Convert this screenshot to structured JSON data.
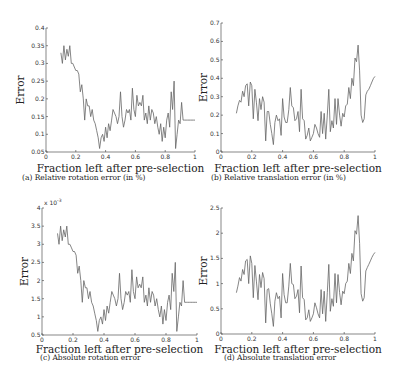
{
  "figure": {
    "panels": [
      {
        "id": "a",
        "caption": "(a)  Relative rotation error (in %)"
      },
      {
        "id": "b",
        "caption": "(b)  Relative translation error (in %)"
      },
      {
        "id": "c",
        "caption": "(c)  Absolute rotation error"
      },
      {
        "id": "d",
        "caption": "(d)  Absolute translation error"
      }
    ]
  },
  "chart_data": [
    {
      "type": "line",
      "title": "(a) Relative rotation error (in %)",
      "xlabel": "Fraction left after pre-selection",
      "ylabel": "Error",
      "xlim": [
        0,
        1
      ],
      "ylim": [
        0.05,
        0.4
      ],
      "xticks": [
        "0",
        "0.2",
        "0.4",
        "0.6",
        "0.8",
        "1"
      ],
      "yticks": [
        "0.05",
        "0.1",
        "0.15",
        "0.2",
        "0.25",
        "0.3",
        "0.35",
        "0.4"
      ],
      "grid": false,
      "x": [
        0.1,
        0.11,
        0.12,
        0.13,
        0.14,
        0.15,
        0.16,
        0.17,
        0.18,
        0.19,
        0.2,
        0.21,
        0.22,
        0.23,
        0.24,
        0.25,
        0.26,
        0.27,
        0.28,
        0.29,
        0.3,
        0.31,
        0.32,
        0.33,
        0.34,
        0.35,
        0.36,
        0.37,
        0.38,
        0.39,
        0.4,
        0.41,
        0.42,
        0.43,
        0.44,
        0.45,
        0.46,
        0.47,
        0.48,
        0.49,
        0.5,
        0.51,
        0.52,
        0.53,
        0.54,
        0.55,
        0.56,
        0.57,
        0.58,
        0.59,
        0.6,
        0.61,
        0.62,
        0.63,
        0.64,
        0.65,
        0.66,
        0.67,
        0.68,
        0.69,
        0.7,
        0.71,
        0.72,
        0.73,
        0.74,
        0.75,
        0.76,
        0.77,
        0.78,
        0.79,
        0.8,
        0.81,
        0.82,
        0.83,
        0.84,
        0.85,
        0.86,
        0.87,
        0.88,
        0.89,
        0.9,
        0.91,
        0.92,
        0.93,
        0.94,
        0.95,
        0.96,
        0.97,
        0.98,
        0.99,
        1.0
      ],
      "values": [
        0.33,
        0.3,
        0.35,
        0.31,
        0.34,
        0.32,
        0.35,
        0.3,
        0.3,
        0.29,
        0.28,
        0.28,
        0.27,
        0.22,
        0.24,
        0.2,
        0.14,
        0.2,
        0.18,
        0.18,
        0.15,
        0.17,
        0.14,
        0.13,
        0.11,
        0.09,
        0.06,
        0.09,
        0.1,
        0.08,
        0.12,
        0.09,
        0.13,
        0.11,
        0.14,
        0.17,
        0.16,
        0.15,
        0.13,
        0.15,
        0.22,
        0.15,
        0.12,
        0.14,
        0.17,
        0.16,
        0.17,
        0.14,
        0.23,
        0.17,
        0.15,
        0.21,
        0.18,
        0.19,
        0.18,
        0.21,
        0.14,
        0.16,
        0.13,
        0.18,
        0.14,
        0.17,
        0.16,
        0.13,
        0.15,
        0.12,
        0.1,
        0.13,
        0.08,
        0.12,
        0.09,
        0.14,
        0.16,
        0.12,
        0.22,
        0.17,
        0.25,
        0.06,
        0.1,
        0.14,
        0.13,
        0.19,
        0.14,
        0.14,
        0.14,
        0.14,
        0.14,
        0.14,
        0.14,
        0.14,
        0.14
      ]
    },
    {
      "type": "line",
      "title": "(b) Relative translation error (in %)",
      "xlabel": "Fraction left after pre-selection",
      "ylabel": "Error",
      "xlim": [
        0,
        1
      ],
      "ylim": [
        0,
        0.7
      ],
      "xticks": [
        "0",
        "0.2",
        "0.4",
        "0.6",
        "0.8",
        "1"
      ],
      "yticks": [
        "0",
        "0.1",
        "0.2",
        "0.3",
        "0.4",
        "0.5",
        "0.6",
        "0.7"
      ],
      "grid": false,
      "x": [
        0.1,
        0.11,
        0.12,
        0.13,
        0.14,
        0.15,
        0.16,
        0.17,
        0.18,
        0.19,
        0.2,
        0.21,
        0.22,
        0.23,
        0.24,
        0.25,
        0.26,
        0.27,
        0.28,
        0.29,
        0.3,
        0.31,
        0.32,
        0.33,
        0.34,
        0.35,
        0.36,
        0.37,
        0.38,
        0.39,
        0.4,
        0.41,
        0.42,
        0.43,
        0.44,
        0.45,
        0.46,
        0.47,
        0.48,
        0.49,
        0.5,
        0.51,
        0.52,
        0.53,
        0.54,
        0.55,
        0.56,
        0.57,
        0.58,
        0.59,
        0.6,
        0.61,
        0.62,
        0.63,
        0.64,
        0.65,
        0.66,
        0.67,
        0.68,
        0.69,
        0.7,
        0.71,
        0.72,
        0.73,
        0.74,
        0.75,
        0.76,
        0.77,
        0.78,
        0.79,
        0.8,
        0.81,
        0.82,
        0.83,
        0.84,
        0.85,
        0.86,
        0.87,
        0.88,
        0.89,
        0.9,
        0.91,
        0.92,
        0.93,
        0.94,
        0.95,
        0.96,
        0.97,
        0.98,
        0.99,
        1.0
      ],
      "values": [
        0.21,
        0.25,
        0.28,
        0.27,
        0.33,
        0.3,
        0.36,
        0.37,
        0.25,
        0.38,
        0.36,
        0.18,
        0.34,
        0.27,
        0.17,
        0.29,
        0.23,
        0.3,
        0.27,
        0.06,
        0.22,
        0.22,
        0.15,
        0.1,
        0.04,
        0.16,
        0.2,
        0.17,
        0.18,
        0.09,
        0.29,
        0.19,
        0.16,
        0.16,
        0.23,
        0.35,
        0.25,
        0.24,
        0.17,
        0.18,
        0.22,
        0.11,
        0.34,
        0.18,
        0.17,
        0.07,
        0.09,
        0.13,
        0.06,
        0.08,
        0.1,
        0.15,
        0.13,
        0.1,
        0.08,
        0.22,
        0.1,
        0.21,
        0.07,
        0.2,
        0.34,
        0.11,
        0.17,
        0.13,
        0.29,
        0.15,
        0.29,
        0.2,
        0.14,
        0.21,
        0.19,
        0.25,
        0.26,
        0.35,
        0.29,
        0.4,
        0.36,
        0.51,
        0.49,
        0.58,
        0.44,
        0.2,
        0.16,
        0.18,
        0.31,
        0.33,
        0.34,
        0.36,
        0.38,
        0.4,
        0.41
      ]
    },
    {
      "type": "line",
      "title": "(c) Absolute rotation error",
      "xlabel": "Fraction left after pre-selection",
      "ylabel": "Error",
      "y_multiplier": "x 10^-3",
      "xlim": [
        0,
        1
      ],
      "ylim": [
        0.5,
        4
      ],
      "xticks": [
        "0",
        "0.2",
        "0.4",
        "0.6",
        "0.8",
        "1"
      ],
      "yticks": [
        "0.5",
        "1",
        "1.5",
        "2",
        "2.5",
        "3",
        "3.5",
        "4"
      ],
      "grid": false,
      "x": [
        0.1,
        0.11,
        0.12,
        0.13,
        0.14,
        0.15,
        0.16,
        0.17,
        0.18,
        0.19,
        0.2,
        0.21,
        0.22,
        0.23,
        0.24,
        0.25,
        0.26,
        0.27,
        0.28,
        0.29,
        0.3,
        0.31,
        0.32,
        0.33,
        0.34,
        0.35,
        0.36,
        0.37,
        0.38,
        0.39,
        0.4,
        0.41,
        0.42,
        0.43,
        0.44,
        0.45,
        0.46,
        0.47,
        0.48,
        0.49,
        0.5,
        0.51,
        0.52,
        0.53,
        0.54,
        0.55,
        0.56,
        0.57,
        0.58,
        0.59,
        0.6,
        0.61,
        0.62,
        0.63,
        0.64,
        0.65,
        0.66,
        0.67,
        0.68,
        0.69,
        0.7,
        0.71,
        0.72,
        0.73,
        0.74,
        0.75,
        0.76,
        0.77,
        0.78,
        0.79,
        0.8,
        0.81,
        0.82,
        0.83,
        0.84,
        0.85,
        0.86,
        0.87,
        0.88,
        0.89,
        0.9,
        0.91,
        0.92,
        0.93,
        0.94,
        0.95,
        0.96,
        0.97,
        0.98,
        0.99,
        1.0
      ],
      "values": [
        3.3,
        3.0,
        3.5,
        3.1,
        3.4,
        3.2,
        3.5,
        3.0,
        3.0,
        2.9,
        2.8,
        2.8,
        2.7,
        2.2,
        2.4,
        2.0,
        1.4,
        2.0,
        1.8,
        1.8,
        1.5,
        1.7,
        1.4,
        1.3,
        1.1,
        0.9,
        0.6,
        0.9,
        1.0,
        0.8,
        1.2,
        0.9,
        1.3,
        1.1,
        1.4,
        1.7,
        1.6,
        1.5,
        1.3,
        1.5,
        2.2,
        1.5,
        1.2,
        1.4,
        1.7,
        1.6,
        1.7,
        1.4,
        2.3,
        1.7,
        1.5,
        2.1,
        1.8,
        1.9,
        1.8,
        2.1,
        1.4,
        1.6,
        1.3,
        1.8,
        1.4,
        1.7,
        1.6,
        1.3,
        1.5,
        1.2,
        1.0,
        1.3,
        0.8,
        1.2,
        0.9,
        1.4,
        1.6,
        1.2,
        2.2,
        1.7,
        2.5,
        0.6,
        1.0,
        1.4,
        1.3,
        2.0,
        1.4,
        1.4,
        1.4,
        1.4,
        1.4,
        1.4,
        1.4,
        1.4,
        1.4
      ]
    },
    {
      "type": "line",
      "title": "(d) Absolute translation error",
      "xlabel": "Fraction left after pre-selection",
      "ylabel": "Error",
      "xlim": [
        0,
        1
      ],
      "ylim": [
        0,
        2.5
      ],
      "xticks": [
        "0",
        "0.2",
        "0.4",
        "0.6",
        "0.8",
        "1"
      ],
      "yticks": [
        "0",
        "0.5",
        "1",
        "1.5",
        "2",
        "2.5"
      ],
      "grid": false,
      "x": [
        0.1,
        0.11,
        0.12,
        0.13,
        0.14,
        0.15,
        0.16,
        0.17,
        0.18,
        0.19,
        0.2,
        0.21,
        0.22,
        0.23,
        0.24,
        0.25,
        0.26,
        0.27,
        0.28,
        0.29,
        0.3,
        0.31,
        0.32,
        0.33,
        0.34,
        0.35,
        0.36,
        0.37,
        0.38,
        0.39,
        0.4,
        0.41,
        0.42,
        0.43,
        0.44,
        0.45,
        0.46,
        0.47,
        0.48,
        0.49,
        0.5,
        0.51,
        0.52,
        0.53,
        0.54,
        0.55,
        0.56,
        0.57,
        0.58,
        0.59,
        0.6,
        0.61,
        0.62,
        0.63,
        0.64,
        0.65,
        0.66,
        0.67,
        0.68,
        0.69,
        0.7,
        0.71,
        0.72,
        0.73,
        0.74,
        0.75,
        0.76,
        0.77,
        0.78,
        0.79,
        0.8,
        0.81,
        0.82,
        0.83,
        0.84,
        0.85,
        0.86,
        0.87,
        0.88,
        0.89,
        0.9,
        0.91,
        0.92,
        0.93,
        0.94,
        0.95,
        0.96,
        0.97,
        0.98,
        0.99,
        1.0
      ],
      "values": [
        0.82,
        0.95,
        1.12,
        1.05,
        1.28,
        1.18,
        1.45,
        1.48,
        1.0,
        1.55,
        1.4,
        0.72,
        1.36,
        1.05,
        0.68,
        1.18,
        0.92,
        1.22,
        1.1,
        0.22,
        0.88,
        0.9,
        0.6,
        0.4,
        0.15,
        0.65,
        0.82,
        0.7,
        0.75,
        0.32,
        1.2,
        0.78,
        0.62,
        0.62,
        0.95,
        1.4,
        1.0,
        0.98,
        0.7,
        0.75,
        0.88,
        0.42,
        1.35,
        0.72,
        0.68,
        0.28,
        0.32,
        0.48,
        0.25,
        0.32,
        0.4,
        0.62,
        0.52,
        0.4,
        0.32,
        0.88,
        0.4,
        0.85,
        0.25,
        0.82,
        1.38,
        0.45,
        0.7,
        0.55,
        1.2,
        0.62,
        1.18,
        0.82,
        0.58,
        0.85,
        0.8,
        1.0,
        1.05,
        1.4,
        1.2,
        1.6,
        1.45,
        2.05,
        1.98,
        2.35,
        1.8,
        0.8,
        0.65,
        0.72,
        1.25,
        1.32,
        1.38,
        1.45,
        1.52,
        1.58,
        1.62
      ]
    }
  ]
}
